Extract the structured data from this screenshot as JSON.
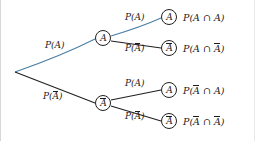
{
  "figure": {
    "type": "probability-tree-diagram",
    "background_color": "#ffffff",
    "branch_color": "#231f20",
    "highlight_color": "#4a7fa5",
    "text_color": "#1a1a1a"
  },
  "nodes": {
    "root": {
      "label": "",
      "x": 14,
      "y": 72
    },
    "level1": [
      {
        "id": "A",
        "letter": "A",
        "overbar": false,
        "x": 102,
        "y": 38
      },
      {
        "id": "Abar",
        "letter": "A",
        "overbar": true,
        "x": 102,
        "y": 103
      }
    ],
    "level2": [
      {
        "id": "AA",
        "letter": "A",
        "overbar": false,
        "x": 168,
        "y": 17
      },
      {
        "id": "AAbar",
        "letter": "A",
        "overbar": true,
        "x": 168,
        "y": 48
      },
      {
        "id": "AbarA",
        "letter": "A",
        "overbar": false,
        "x": 168,
        "y": 90
      },
      {
        "id": "AbarAbar",
        "letter": "A",
        "overbar": true,
        "x": 168,
        "y": 121
      }
    ]
  },
  "branch_labels": {
    "root_upper": {
      "prefix": "P(",
      "arg": "A",
      "overbar": false,
      "suffix": ")",
      "x": 44,
      "y": 41,
      "highlighted": true
    },
    "root_lower": {
      "prefix": "P(",
      "arg": "A",
      "overbar": true,
      "suffix": ")",
      "x": 42,
      "y": 92,
      "highlighted": false
    },
    "a_upper": {
      "prefix": "P(",
      "arg": "A",
      "overbar": false,
      "suffix": ")",
      "x": 124,
      "y": 13,
      "highlighted": true
    },
    "a_lower": {
      "prefix": "P(",
      "arg": "A",
      "overbar": true,
      "suffix": ")",
      "x": 124,
      "y": 44,
      "highlighted": false
    },
    "abar_upper": {
      "prefix": "P(",
      "arg": "A",
      "overbar": false,
      "suffix": ")",
      "x": 124,
      "y": 79,
      "highlighted": false
    },
    "abar_lower": {
      "prefix": "P(",
      "arg": "A",
      "overbar": true,
      "suffix": ")",
      "x": 124,
      "y": 112,
      "highlighted": false
    }
  },
  "outcomes": [
    {
      "id": "outcome-a-a",
      "prefix": "P(",
      "first": "A",
      "first_overbar": false,
      "op": " ∩ ",
      "second": "A",
      "second_overbar": false,
      "suffix": ")",
      "x": 182,
      "y": 13
    },
    {
      "id": "outcome-a-abar",
      "prefix": "P(",
      "first": "A",
      "first_overbar": false,
      "op": " ∩ ",
      "second": "A",
      "second_overbar": true,
      "suffix": ")",
      "x": 182,
      "y": 44
    },
    {
      "id": "outcome-abar-a",
      "prefix": "P(",
      "first": "A",
      "first_overbar": true,
      "op": " ∩ ",
      "second": "A",
      "second_overbar": false,
      "suffix": ")",
      "x": 182,
      "y": 86
    },
    {
      "id": "outcome-abar-abar",
      "prefix": "P(",
      "first": "A",
      "first_overbar": true,
      "op": " ∩ ",
      "second": "A",
      "second_overbar": true,
      "suffix": ")",
      "x": 182,
      "y": 117
    }
  ]
}
